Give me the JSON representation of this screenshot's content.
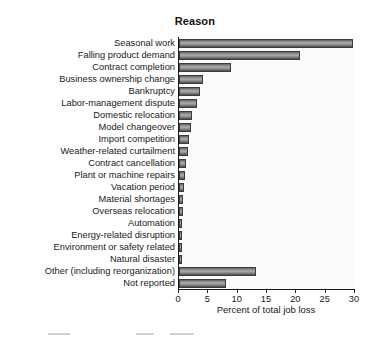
{
  "header": {
    "column_title": "Reason"
  },
  "chart_data": {
    "type": "bar",
    "orientation": "horizontal",
    "title": "",
    "xlabel": "Percent of total job loss",
    "ylabel": "Reason",
    "xlim": [
      0,
      30
    ],
    "xticks": [
      0,
      5,
      10,
      15,
      20,
      25,
      30
    ],
    "grid": false,
    "legend": "none",
    "bar_color": "#8f8f8f",
    "bar_edge_color": "#3c3c3c",
    "categories": [
      "Seasonal work",
      "Falling product demand",
      "Contract completion",
      "Business ownership change",
      "Bankruptcy",
      "Labor-management dispute",
      "Domestic relocation",
      "Model changeover",
      "Import competition",
      "Weather-related curtailment",
      "Contract cancellation",
      "Plant or machine repairs",
      "Vacation period",
      "Material shortages",
      "Overseas relocation",
      "Automation",
      "Energy-related disruption",
      "Environment or safety related",
      "Natural disaster",
      "Other (including reorganization)",
      "Not reported"
    ],
    "values": [
      29.3,
      20.2,
      8.6,
      3.8,
      3.2,
      2.8,
      1.9,
      1.7,
      1.4,
      1.2,
      0.9,
      0.6,
      0.45,
      0.4,
      0.3,
      0.25,
      0.2,
      0.18,
      0.12,
      12.7,
      7.6
    ]
  }
}
